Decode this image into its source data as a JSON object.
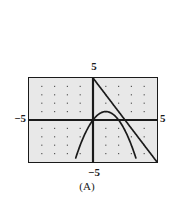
{
  "figure": {
    "caption": "(A)",
    "axis_labels": {
      "top": "5",
      "left": "−5",
      "right": "5",
      "bottom": "−5"
    },
    "colors": {
      "plot_background": "#e8e8e8",
      "frame": "#1a1a1a",
      "axis": "#1a1a1a",
      "grid_dot": "#555555",
      "curve": "#1a1a1a",
      "page_background": "#ffffff"
    }
  },
  "chart_data": {
    "type": "line",
    "title": "",
    "subtitle": "",
    "xlabel": "",
    "ylabel": "",
    "xlim": [
      -5,
      5
    ],
    "ylim": [
      -5,
      5
    ],
    "xticks": [
      -5,
      5
    ],
    "yticks": [
      -5,
      5
    ],
    "xtick_labels": [
      "−5",
      "5"
    ],
    "ytick_labels": [
      "−5",
      "5"
    ],
    "grid": "dotted",
    "grid_spacing": 1,
    "legend": "none",
    "axes_style": "centered-cross",
    "annotations": [
      "(A)"
    ],
    "series": [
      {
        "name": "parabola",
        "kind": "quadratic",
        "equation": "y = -x^2 + 2x",
        "vertex": [
          1,
          1
        ],
        "opens": "down",
        "x": [
          -1.2,
          -1.0,
          -0.8,
          -0.6,
          -0.4,
          -0.2,
          0.0,
          0.2,
          0.4,
          0.6,
          0.8,
          1.0,
          1.2,
          1.4,
          1.6,
          1.8,
          2.0,
          2.2,
          2.4,
          2.6,
          2.8,
          3.0,
          3.2
        ],
        "values": [
          -3.84,
          -3.0,
          -2.24,
          -1.56,
          -0.96,
          -0.44,
          0.0,
          0.36,
          0.64,
          0.84,
          0.96,
          1.0,
          0.96,
          0.84,
          0.64,
          0.36,
          0.0,
          -0.44,
          -0.96,
          -1.56,
          -2.24,
          -3.0,
          -3.84
        ]
      },
      {
        "name": "line",
        "kind": "linear",
        "equation": "y = -2x + 5",
        "slope": -2,
        "intercept": 5,
        "x": [
          -0.2,
          5.0
        ],
        "values": [
          5.4,
          -5.0
        ]
      }
    ],
    "intersections": [
      [
        1.0,
        1.0
      ],
      [
        2.9,
        -2.6
      ]
    ]
  }
}
